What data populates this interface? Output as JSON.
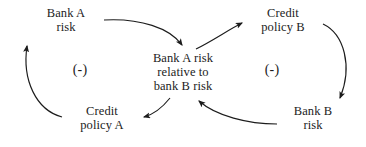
{
  "diagram": {
    "type": "causal-loop-diagram",
    "background_color": "#ffffff",
    "line_color": "#1c1c1c",
    "text_color": "#1c1c1c",
    "width": 366,
    "height": 147,
    "nodes": [
      {
        "id": "bank-a-risk",
        "label": "Bank A\nrisk",
        "x": 66,
        "y": 20
      },
      {
        "id": "credit-policy-b",
        "label": "Credit\npolicy B",
        "x": 283,
        "y": 20
      },
      {
        "id": "center-ratio",
        "label": "Bank A risk\nrelative to\nbank B risk",
        "x": 183,
        "y": 74
      },
      {
        "id": "credit-policy-a",
        "label": "Credit\npolicy A",
        "x": 102,
        "y": 118
      },
      {
        "id": "bank-b-risk",
        "label": "Bank B\nrisk",
        "x": 313,
        "y": 118
      }
    ],
    "loop_markers": [
      {
        "id": "left-loop-polarity",
        "label": "(-)",
        "x": 80,
        "y": 70
      },
      {
        "id": "right-loop-polarity",
        "label": "(-)",
        "x": 272,
        "y": 70
      }
    ],
    "edges": [
      {
        "id": "bank-a-risk-to-center",
        "from": "bank-a-risk",
        "to": "center-ratio",
        "polarity": ""
      },
      {
        "id": "center-to-credit-policy-b",
        "from": "center-ratio",
        "to": "credit-policy-b",
        "polarity": ""
      },
      {
        "id": "credit-policy-b-to-bank-b",
        "from": "credit-policy-b",
        "to": "bank-b-risk",
        "polarity": ""
      },
      {
        "id": "bank-b-risk-to-center",
        "from": "bank-b-risk",
        "to": "center-ratio",
        "polarity": ""
      },
      {
        "id": "center-to-credit-policy-a",
        "from": "center-ratio",
        "to": "credit-policy-a",
        "polarity": ""
      },
      {
        "id": "credit-policy-a-to-bank-a",
        "from": "credit-policy-a",
        "to": "bank-a-risk",
        "polarity": ""
      }
    ]
  }
}
